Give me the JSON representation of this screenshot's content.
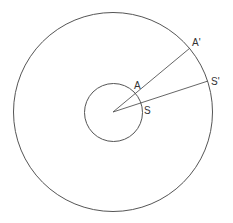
{
  "diagram": {
    "width": 233,
    "height": 223,
    "stroke_color": "#555555",
    "background": "#ffffff",
    "center": {
      "x": 113,
      "y": 112
    },
    "outer_circle": {
      "r": 99.5
    },
    "inner_circle": {
      "r": 29
    },
    "rays": [
      {
        "name": "ray-a",
        "to": {
          "x": 190,
          "y": 48
        }
      },
      {
        "name": "ray-s",
        "to": {
          "x": 208,
          "y": 81
        }
      }
    ],
    "labels": {
      "A": "A",
      "S": "S",
      "A_prime": "A'",
      "S_prime": "S'"
    }
  }
}
